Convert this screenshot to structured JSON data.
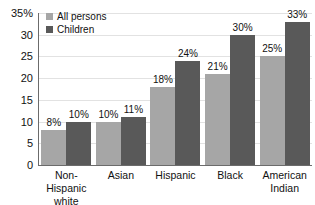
{
  "chart_data": {
    "type": "bar",
    "title": "",
    "xlabel": "",
    "ylabel": "",
    "ylim": [
      0,
      35
    ],
    "yticks": [
      "0",
      "5",
      "10",
      "15",
      "20",
      "25",
      "30",
      "35%"
    ],
    "ytick_values": [
      0,
      5,
      10,
      15,
      20,
      25,
      30,
      35
    ],
    "grid": true,
    "legend_position": "top-left",
    "categories": [
      "Non-Hispanic white",
      "Asian",
      "Hispanic",
      "Black",
      "American Indian"
    ],
    "category_lines": [
      [
        "Non-Hispanic",
        "white"
      ],
      [
        "Asian"
      ],
      [
        "Hispanic"
      ],
      [
        "Black"
      ],
      [
        "American",
        "Indian"
      ]
    ],
    "series": [
      {
        "name": "All persons",
        "color": "#a6a6a6",
        "values": [
          8,
          10,
          18,
          21,
          25
        ],
        "labels": [
          "8%",
          "10%",
          "18%",
          "21%",
          "25%"
        ]
      },
      {
        "name": "Children",
        "color": "#595959",
        "values": [
          10,
          11,
          24,
          30,
          33
        ],
        "labels": [
          "10%",
          "11%",
          "24%",
          "30%",
          "33%"
        ]
      }
    ]
  },
  "legend": {
    "items": [
      {
        "label": "All persons"
      },
      {
        "label": "Children"
      }
    ]
  },
  "colors": {
    "all_persons": "#a6a6a6",
    "children": "#595959",
    "gridline": "#e2e2e2",
    "axis": "#6b6b6b",
    "text": "#111111",
    "background": "#ffffff"
  }
}
